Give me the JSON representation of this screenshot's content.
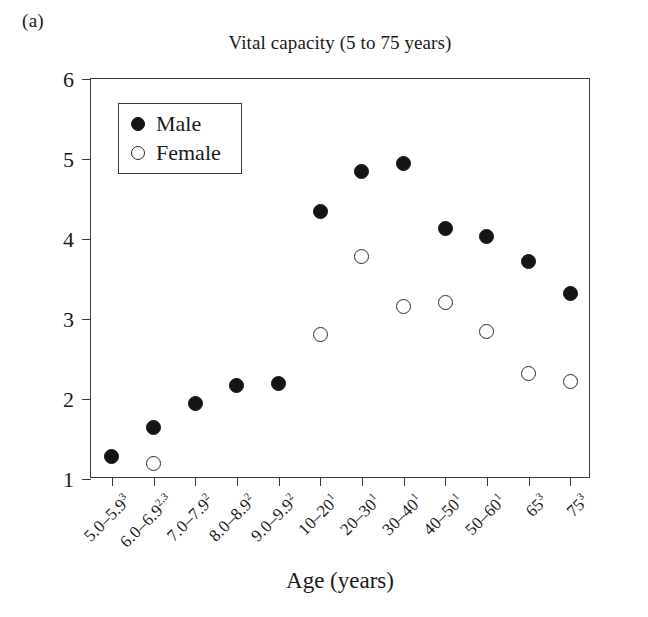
{
  "panel_label": "(a)",
  "axis_title_x": "Age (years)",
  "axis_title_y": "Vital capacity (liters)",
  "legend": {
    "male_label": "Male",
    "female_label": "Female",
    "male_color": "#141414",
    "female_color": "#ffffff",
    "border_color": "#3a3a3a"
  },
  "chart_data": {
    "type": "scatter",
    "title": "Vital capacity (5 to 75 years)",
    "xlabel": "Age (years)",
    "ylabel": "Vital capacity (liters)",
    "ylim": [
      1,
      6
    ],
    "yticks": [
      1,
      2,
      3,
      4,
      5,
      6
    ],
    "grid": false,
    "legend_position": "upper-left-inside",
    "categories": [
      "5.0–5.9",
      "6.0–6.9",
      "7.0–7.9",
      "8.0–8.9",
      "9.0–9.9",
      "10–20",
      "20–30",
      "30–40",
      "40–50",
      "50–60",
      "65",
      "75"
    ],
    "category_footnotes": [
      "3",
      "2,3",
      "2",
      "2",
      "2",
      "1",
      "1",
      "1",
      "1",
      "1",
      "3",
      "3"
    ],
    "series": [
      {
        "name": "Male",
        "marker": "filled-circle",
        "color": "#141414",
        "values": [
          1.28,
          1.65,
          1.94,
          2.17,
          2.19,
          4.35,
          4.85,
          4.95,
          4.13,
          4.03,
          3.72,
          3.32
        ]
      },
      {
        "name": "Female",
        "marker": "open-circle",
        "color": "#ffffff",
        "values": [
          null,
          1.2,
          null,
          null,
          null,
          2.81,
          3.78,
          3.16,
          3.21,
          2.85,
          2.32,
          2.22
        ]
      }
    ]
  }
}
